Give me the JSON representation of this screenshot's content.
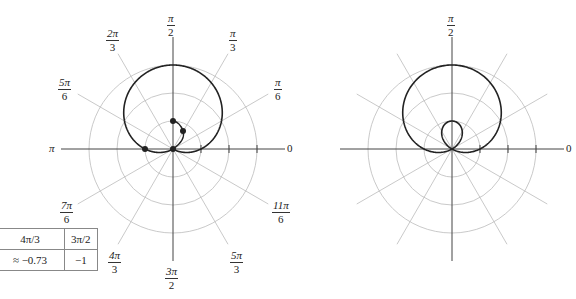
{
  "figure": {
    "left_plot": {
      "angle_labels": [
        {
          "key": "pi_over_2",
          "num": "π",
          "den": "2"
        },
        {
          "key": "pi_over_3",
          "num": "π",
          "den": "3"
        },
        {
          "key": "2pi_over_3",
          "num": "2π",
          "den": "3"
        },
        {
          "key": "pi_over_6",
          "num": "π",
          "den": "6"
        },
        {
          "key": "5pi_over_6",
          "num": "5π",
          "den": "6"
        },
        {
          "key": "pi",
          "text": "π"
        },
        {
          "key": "zero",
          "text": "0"
        },
        {
          "key": "7pi_over_6",
          "num": "7π",
          "den": "6"
        },
        {
          "key": "11pi_over_6",
          "num": "11π",
          "den": "6"
        },
        {
          "key": "4pi_over_3",
          "num": "4π",
          "den": "3"
        },
        {
          "key": "5pi_over_3",
          "num": "5π",
          "den": "3"
        },
        {
          "key": "3pi_over_2",
          "num": "3π",
          "den": "2"
        }
      ],
      "plotted_points": [
        [
          0,
          0
        ],
        [
          -1,
          0
        ],
        [
          0,
          1
        ],
        [
          0.5,
          0.87
        ]
      ]
    },
    "right_plot": {
      "angle_labels": [
        {
          "key": "pi_over_2",
          "num": "π",
          "den": "2"
        },
        {
          "key": "zero",
          "text": "0"
        }
      ]
    },
    "table": {
      "headers": [
        "4π/3",
        "3π/2"
      ],
      "values": [
        "≈ −0.73",
        "−1"
      ]
    }
  },
  "chart_data": {
    "type": "line",
    "coordinate_system": "polar",
    "rings": [
      1,
      2,
      3
    ],
    "angle_ticks": [
      "0",
      "π/6",
      "π/3",
      "π/2",
      "2π/3",
      "5π/6",
      "π",
      "7π/6",
      "4π/3",
      "3π/2",
      "5π/3",
      "11π/6"
    ],
    "series": [
      {
        "name": "left: partial trace with plotted points",
        "points": [
          [
            0,
            0
          ],
          [
            -1,
            0
          ],
          [
            0,
            1
          ],
          [
            0.5,
            0.87
          ]
        ]
      },
      {
        "name": "right: full limaçon with inner loop",
        "max_r": 3,
        "inner_loop_max_r": 1
      }
    ],
    "table": {
      "theta": [
        "4π/3",
        "3π/2"
      ],
      "r": [
        "≈ −0.73",
        "−1"
      ]
    }
  },
  "colors": {
    "curve": "#222222",
    "grid": "#bbbbbb",
    "axis": "#444444"
  }
}
